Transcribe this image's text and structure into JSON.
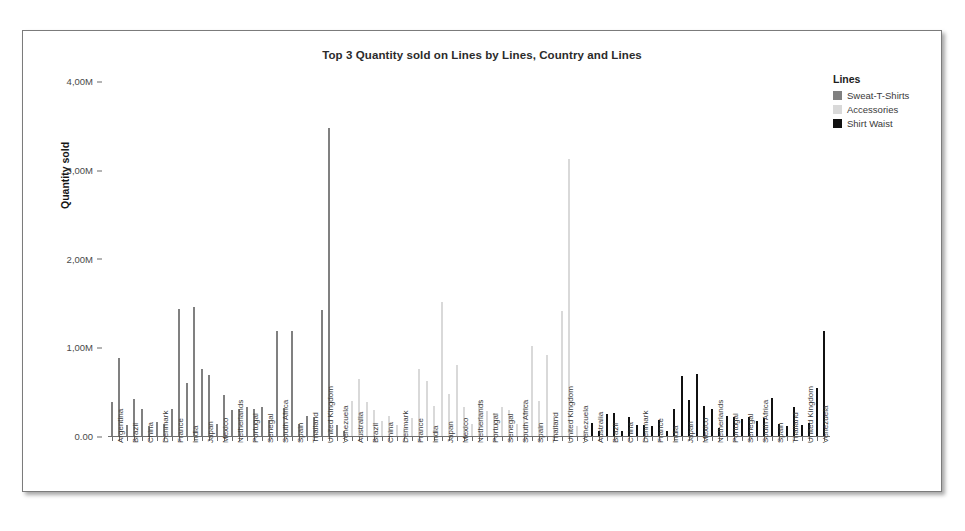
{
  "chart_data": {
    "type": "bar",
    "title": "Top 3 Quantity sold on Lines by Lines, Country and Lines",
    "xlabel": "",
    "ylabel": "Quantity sold",
    "ylim": [
      0,
      4000000
    ],
    "grid": false,
    "legend_position": "right",
    "legend_title": "Lines",
    "y_ticks": [
      {
        "value": 0,
        "label": "0.00"
      },
      {
        "value": 1000000,
        "label": "1,00M"
      },
      {
        "value": 2000000,
        "label": "2,00M"
      },
      {
        "value": 3000000,
        "label": "3,00M"
      },
      {
        "value": 4000000,
        "label": "4,00M"
      }
    ],
    "series_colors": {
      "Sweat-T-Shirts": "#808080",
      "Accessories": "#d9d9d9",
      "Shirt Waist": "#111111"
    },
    "legend_entries": [
      {
        "label": "Sweat-T-Shirts",
        "color": "#808080"
      },
      {
        "label": "Accessories",
        "color": "#d9d9d9"
      },
      {
        "label": "Shirt Waist",
        "color": "#111111"
      }
    ],
    "panels": [
      {
        "line": "Sweat-T-Shirts",
        "color": "#808080",
        "countries": [
          {
            "country": "Argentina",
            "values": [
              380000,
              880000
            ]
          },
          {
            "country": "Brazil",
            "values": [
              120000,
              420000
            ]
          },
          {
            "country": "China",
            "values": [
              300000,
              110000
            ]
          },
          {
            "country": "Denmark",
            "values": [
              160000,
              130000
            ]
          },
          {
            "country": "France",
            "values": [
              300000,
              1430000
            ]
          },
          {
            "country": "India",
            "values": [
              600000,
              1450000
            ]
          },
          {
            "country": "Japan",
            "values": [
              760000,
              690000
            ]
          },
          {
            "country": "Mexico",
            "values": [
              140000,
              460000
            ]
          },
          {
            "country": "Netherlands",
            "values": [
              290000,
              310000
            ]
          },
          {
            "country": "Portugal",
            "values": [
              330000,
              300000
            ]
          },
          {
            "country": "Senegal",
            "values": [
              330000,
              180000
            ]
          },
          {
            "country": "South Africa",
            "values": [
              1180000,
              320000
            ]
          },
          {
            "country": "Spain",
            "values": [
              1180000,
              130000
            ]
          },
          {
            "country": "Thailand",
            "values": [
              230000,
              210000
            ]
          },
          {
            "country": "United Kingdom",
            "values": [
              1420000,
              3470000
            ]
          },
          {
            "country": "Venezuela",
            "values": [
              120000,
              60000
            ]
          }
        ]
      },
      {
        "line": "Accessories",
        "color": "#d9d9d9",
        "countries": [
          {
            "country": "Australia",
            "values": [
              390000,
              640000
            ]
          },
          {
            "country": "Brazil",
            "values": [
              380000,
              290000
            ]
          },
          {
            "country": "China",
            "values": [
              170000,
              220000
            ]
          },
          {
            "country": "Denmark",
            "values": [
              120000,
              90000
            ]
          },
          {
            "country": "France",
            "values": [
              200000,
              760000
            ]
          },
          {
            "country": "India",
            "values": [
              620000,
              340000
            ]
          },
          {
            "country": "Japan",
            "values": [
              1510000,
              470000
            ]
          },
          {
            "country": "Mexico",
            "values": [
              800000,
              330000
            ]
          },
          {
            "country": "Netherlands",
            "values": [
              140000,
              400000
            ]
          },
          {
            "country": "Portugal",
            "values": [
              280000,
              260000
            ]
          },
          {
            "country": "Senegal",
            "values": [
              330000,
              290000
            ]
          },
          {
            "country": "South Africa",
            "values": [
              130000,
              380000
            ]
          },
          {
            "country": "Spain",
            "values": [
              1010000,
              400000
            ]
          },
          {
            "country": "Thailand",
            "values": [
              910000,
              220000
            ]
          },
          {
            "country": "United Kingdom",
            "values": [
              1410000,
              3120000
            ]
          },
          {
            "country": "Venezuela",
            "values": [
              110000,
              60000
            ]
          }
        ]
      },
      {
        "line": "Shirt Waist",
        "color": "#111111",
        "countries": [
          {
            "country": "Australia",
            "values": [
              150000,
              60000
            ]
          },
          {
            "country": "Brazil",
            "values": [
              250000,
              260000
            ]
          },
          {
            "country": "China",
            "values": [
              60000,
              210000
            ]
          },
          {
            "country": "Denmark",
            "values": [
              120000,
              120000
            ]
          },
          {
            "country": "France",
            "values": [
              110000,
              180000
            ]
          },
          {
            "country": "India",
            "values": [
              60000,
              310000
            ]
          },
          {
            "country": "Japan",
            "values": [
              680000,
              410000
            ]
          },
          {
            "country": "Mexico",
            "values": [
              700000,
              340000
            ]
          },
          {
            "country": "Netherlands",
            "values": [
              310000,
              90000
            ]
          },
          {
            "country": "Portugal",
            "values": [
              220000,
              210000
            ]
          },
          {
            "country": "Senegal",
            "values": [
              190000,
              210000
            ]
          },
          {
            "country": "South Africa",
            "values": [
              170000,
              200000
            ]
          },
          {
            "country": "Spain",
            "values": [
              430000,
              140000
            ]
          },
          {
            "country": "Thailand",
            "values": [
              110000,
              330000
            ]
          },
          {
            "country": "United Kingdom",
            "values": [
              120000,
              150000
            ]
          },
          {
            "country": "Venezuela",
            "values": [
              540000,
              1180000
            ]
          }
        ]
      }
    ]
  }
}
